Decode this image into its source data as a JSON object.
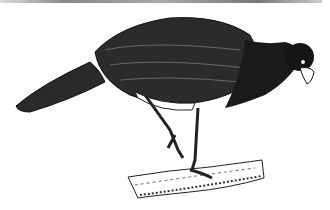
{
  "image": {
    "subject": "curassow bird illustration",
    "style": "black ink line drawing",
    "colors": {
      "ink": "#111111",
      "background": "#ffffff",
      "rule": "#888888"
    }
  }
}
